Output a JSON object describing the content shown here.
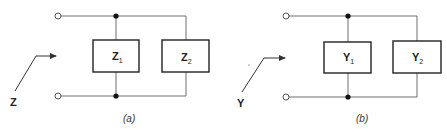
{
  "diagrams": [
    {
      "id": "a",
      "caption": "(a)",
      "input_label": "Z",
      "elements": [
        {
          "symbol": "Z",
          "subscript": "1"
        },
        {
          "symbol": "Z",
          "subscript": "2"
        }
      ]
    },
    {
      "id": "b",
      "caption": "(b)",
      "input_label": "Y",
      "elements": [
        {
          "symbol": "Y",
          "subscript": "1"
        },
        {
          "symbol": "Y",
          "subscript": "2"
        }
      ]
    }
  ],
  "colors": {
    "wire": "#6f6f6f",
    "box": "#222222",
    "node": "#111111",
    "background": "#ffffff"
  }
}
